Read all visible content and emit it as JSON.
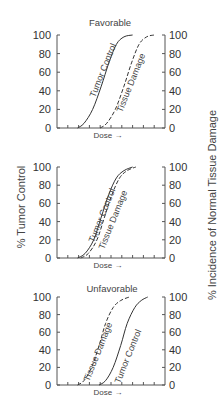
{
  "chart_data": [
    {
      "type": "line",
      "title": "Favorable",
      "xlabel": "Dose →",
      "ylabel_left": "% Tumor Control",
      "ylabel_right": "% Incidence of Normal Tissue Damage",
      "yticks": [
        0,
        20,
        40,
        60,
        80,
        100
      ],
      "ylim": [
        0,
        100
      ],
      "x_ticks_count": 10,
      "series": [
        {
          "name": "Tumor Control",
          "style": "solid",
          "x": [
            1.9,
            2.5,
            3.3,
            4.1,
            4.8,
            5.5,
            6.2,
            7.0
          ],
          "values": [
            0,
            5,
            20,
            45,
            70,
            90,
            98,
            100
          ]
        },
        {
          "name": "Tissue Damage",
          "style": "dashed",
          "x": [
            4.0,
            4.6,
            5.4,
            6.2,
            6.9,
            7.6,
            8.3,
            9.0
          ],
          "values": [
            0,
            5,
            20,
            45,
            70,
            90,
            98,
            100
          ]
        }
      ]
    },
    {
      "type": "line",
      "title": "",
      "xlabel": "Dose →",
      "yticks": [
        0,
        20,
        40,
        60,
        80,
        100
      ],
      "ylim": [
        0,
        100
      ],
      "x_ticks_count": 10,
      "series": [
        {
          "name": "Tumor Control",
          "style": "solid",
          "x": [
            1.9,
            2.6,
            3.4,
            4.1,
            4.8,
            5.5,
            6.2,
            7.0
          ],
          "values": [
            0,
            5,
            20,
            45,
            70,
            88,
            96,
            100
          ]
        },
        {
          "name": "Tissue Damage",
          "style": "dashed",
          "x": [
            2.2,
            2.9,
            3.7,
            4.4,
            5.1,
            5.8,
            6.5,
            7.3
          ],
          "values": [
            0,
            5,
            20,
            45,
            70,
            88,
            96,
            100
          ]
        }
      ]
    },
    {
      "type": "line",
      "title": "Unfavorable",
      "xlabel": "Dose →",
      "yticks": [
        0,
        20,
        40,
        60,
        80,
        100
      ],
      "ylim": [
        0,
        100
      ],
      "x_ticks_count": 10,
      "series": [
        {
          "name": "Tissue Damage",
          "style": "dashed",
          "x": [
            1.9,
            2.5,
            3.2,
            3.9,
            4.5,
            5.2,
            5.9,
            6.7
          ],
          "values": [
            0,
            5,
            20,
            45,
            70,
            88,
            96,
            100
          ]
        },
        {
          "name": "Tumor Control",
          "style": "solid",
          "x": [
            3.9,
            4.5,
            5.2,
            5.9,
            6.5,
            7.2,
            7.8,
            8.4
          ],
          "values": [
            0,
            5,
            20,
            45,
            70,
            88,
            96,
            100
          ]
        }
      ]
    }
  ],
  "labels": {
    "panel1_title": "Favorable",
    "panel3_title": "Unfavorable",
    "dose": "Dose →",
    "tumor_control": "Tumor Control",
    "tissue_damage": "Tissue Damage",
    "left_axis": "% Tumor Control",
    "right_axis": "% Incidence of Normal Tissue Damage",
    "ticks": [
      "0",
      "20",
      "40",
      "60",
      "80",
      "100"
    ]
  }
}
